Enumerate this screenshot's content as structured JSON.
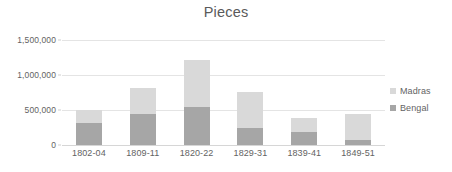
{
  "chart_data": {
    "type": "bar",
    "subtype": "stacked-column",
    "title": "Pieces",
    "xlabel": "",
    "ylabel": "",
    "categories": [
      "1802-04",
      "1809-11",
      "1820-22",
      "1829-31",
      "1839-41",
      "1849-51"
    ],
    "series": [
      {
        "name": "Bengal",
        "color": "#a6a6a6",
        "values": [
          310000,
          450000,
          540000,
          240000,
          180000,
          65000
        ]
      },
      {
        "name": "Madras",
        "color": "#d9d9d9",
        "values": [
          185000,
          370000,
          675000,
          515000,
          200000,
          375000
        ]
      }
    ],
    "stack_order": [
      "Bengal",
      "Madras"
    ],
    "totals": [
      495000,
      820000,
      1215000,
      755000,
      380000,
      440000
    ],
    "ylim": [
      0,
      1500000
    ],
    "y_ticks": [
      0,
      500000,
      1000000,
      1500000
    ],
    "y_tick_labels": [
      "0",
      "500,000",
      "1,000,000",
      "1,500,000"
    ],
    "grid": true,
    "grid_axis": "y",
    "legend_position": "right",
    "legend_entries": [
      "Madras",
      "Bengal"
    ],
    "colors": {
      "madras": "#d9d9d9",
      "bengal": "#a6a6a6",
      "gridline": "#e4e4e4",
      "text": "#636363",
      "background": "#ffffff"
    }
  }
}
